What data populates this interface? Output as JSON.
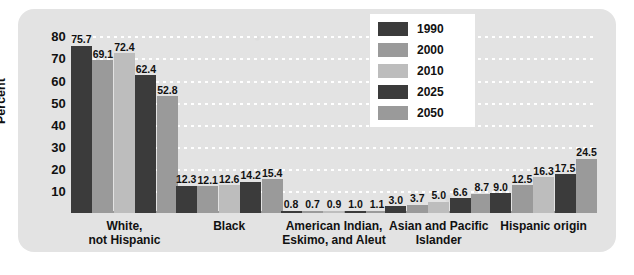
{
  "chart_data": {
    "type": "bar",
    "title": "",
    "subtitle": "",
    "xlabel": "",
    "ylabel": "Percent",
    "ylim": [
      0,
      82
    ],
    "yticks": [
      10,
      20,
      30,
      40,
      50,
      60,
      70,
      80
    ],
    "grid": true,
    "legend_position": "top-right",
    "categories": [
      "White,\nnot Hispanic",
      "Black",
      "American Indian,\nEskimo, and Aleut",
      "Asian and Pacific\nIslander",
      "Hispanic origin"
    ],
    "series": [
      {
        "name": "1990",
        "color": "#3b3b3b",
        "values": [
          75.7,
          12.3,
          0.8,
          3.0,
          9.0
        ]
      },
      {
        "name": "2000",
        "color": "#9a9a9a",
        "values": [
          69.1,
          12.1,
          0.7,
          3.7,
          12.5
        ]
      },
      {
        "name": "2010",
        "color": "#bdbdbd",
        "values": [
          72.4,
          12.6,
          0.9,
          5.0,
          16.3
        ]
      },
      {
        "name": "2025",
        "color": "#3b3b3b",
        "values": [
          62.4,
          14.2,
          1.0,
          6.6,
          17.5
        ]
      },
      {
        "name": "2050",
        "color": "#9a9a9a",
        "values": [
          52.8,
          15.4,
          1.1,
          8.7,
          24.5
        ]
      }
    ],
    "value_labels": {
      "White, not Hispanic": [
        "75.7",
        "69.1",
        "72.4",
        "62.4",
        "52.8"
      ],
      "Black": [
        "12.3",
        "12.1",
        "12.6",
        "14.2",
        "15.4"
      ],
      "American Indian, Eskimo, and Aleut": [
        "0.8",
        "0.7",
        "0.9",
        "1.0",
        "1.1"
      ],
      "Asian and Pacific Islander": [
        "3.0",
        "3.7",
        "5.0",
        "6.6",
        "8.7"
      ],
      "Hispanic origin": [
        "9.0",
        "12.5",
        "16.3",
        "17.5",
        "24.5"
      ]
    },
    "ytick_labels": [
      "80",
      "70",
      "60",
      "50",
      "40",
      "30",
      "20",
      "10"
    ],
    "legend_entries": [
      {
        "label": "1990",
        "color": "#3b3b3b"
      },
      {
        "label": "2000",
        "color": "#9a9a9a"
      },
      {
        "label": "2010",
        "color": "#bdbdbd"
      },
      {
        "label": "2025",
        "color": "#3b3b3b"
      },
      {
        "label": "2050",
        "color": "#9a9a9a"
      }
    ],
    "colors": {
      "panel_background": "#e3e3e3",
      "gridline": "#ffffff",
      "axis": "#9a9a9a",
      "text": "#111111",
      "legend_background": "#ffffff"
    }
  }
}
